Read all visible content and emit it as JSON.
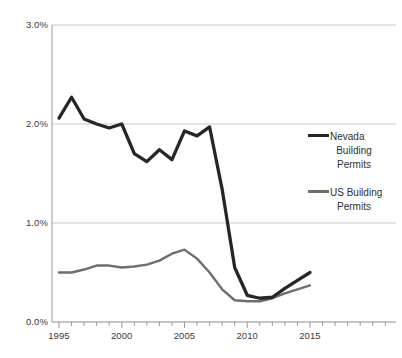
{
  "chart_data": {
    "type": "line",
    "title": "",
    "xlabel": "",
    "ylabel": "",
    "x": [
      1995,
      1996,
      1997,
      1998,
      1999,
      2000,
      2001,
      2002,
      2003,
      2004,
      2005,
      2006,
      2007,
      2008,
      2009,
      2010,
      2011,
      2012,
      2013,
      2014,
      2015
    ],
    "xlim": [
      1995,
      2015
    ],
    "ylim": [
      0.0,
      3.0
    ],
    "yticks": [
      0.0,
      1.0,
      2.0,
      3.0
    ],
    "ytick_labels": [
      "0.0%",
      "1.0%",
      "2.0%",
      "3.0%"
    ],
    "xticks": [
      1995,
      2000,
      2005,
      2010,
      2015
    ],
    "xtick_labels": [
      "1995",
      "2000",
      "2005",
      "2010",
      "2015"
    ],
    "xminor_tick_interval": 1,
    "grid": "horizontal",
    "legend_position": "right",
    "series": [
      {
        "name": "Nevada Building Permits",
        "color": "#262626",
        "values": [
          2.06,
          2.27,
          2.05,
          2.0,
          1.96,
          2.0,
          1.7,
          1.62,
          1.74,
          1.64,
          1.93,
          1.88,
          1.97,
          1.34,
          0.55,
          0.27,
          0.24,
          0.25,
          0.34,
          0.42,
          0.5
        ]
      },
      {
        "name": "US Building Permits",
        "color": "#6e6e6e",
        "values": [
          0.5,
          0.5,
          0.53,
          0.57,
          0.57,
          0.55,
          0.56,
          0.58,
          0.62,
          0.69,
          0.73,
          0.64,
          0.5,
          0.33,
          0.22,
          0.21,
          0.21,
          0.24,
          0.29,
          0.33,
          0.37
        ]
      }
    ]
  },
  "legend": {
    "entries": [
      {
        "label": "Nevada Building Permits",
        "line1": "Nevada",
        "line2": "Building",
        "line3": "Permits",
        "color": "#262626"
      },
      {
        "label": "US Building Permits",
        "line1": "US Building",
        "line2": "Permits",
        "line3": "",
        "color": "#6e6e6e"
      }
    ]
  },
  "axis": {
    "y_labels": [
      "3.0%",
      "2.0%",
      "1.0%",
      "0.0%"
    ],
    "x_labels": [
      "1995",
      "2000",
      "2005",
      "2010",
      "2015"
    ]
  }
}
